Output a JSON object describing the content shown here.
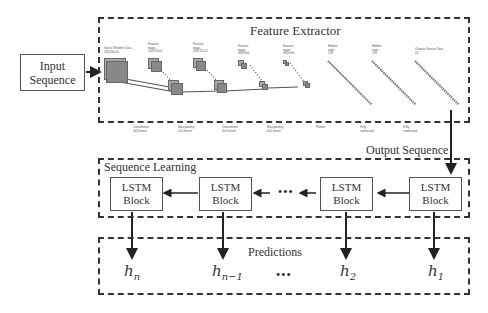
{
  "diagram": {
    "input_box": {
      "line1": "Input",
      "line2": "Sequence"
    },
    "feature_extractor": {
      "title": "Feature Extractor",
      "layer_labels_top": [
        {
          "l1": "Inputs Weather Data",
          "l2": "32@24x24"
        },
        {
          "l1": "Feature",
          "l2": "maps",
          "l3": "24@12x12"
        },
        {
          "l1": "Feature",
          "l2": "maps",
          "l3": "24@12x12"
        },
        {
          "l1": "Feature",
          "l2": "maps",
          "l3": "48@6x6"
        },
        {
          "l1": "Feature",
          "l2": "maps",
          "l3": "48@6x6"
        },
        {
          "l1": "Hidden",
          "l2": "units",
          "l3": "128"
        },
        {
          "l1": "Hidden",
          "l2": "units",
          "l3": "128"
        },
        {
          "l1": "Outputs Sensor Data",
          "l2": "24"
        }
      ],
      "operation_labels_bottom": [
        {
          "l1": "Convolution",
          "l2": "3x3 kernel"
        },
        {
          "l1": "Max-pooling",
          "l2": "2x2 kernel"
        },
        {
          "l1": "Convolution",
          "l2": "3x3 kernel"
        },
        {
          "l1": "Max-pooling",
          "l2": "2x2 kernel"
        },
        {
          "l1": "Flatten",
          "l2": ""
        },
        {
          "l1": "Fully",
          "l2": "connected"
        },
        {
          "l1": "Fully",
          "l2": "connected"
        }
      ]
    },
    "output_sequence_label": "Output Sequence",
    "sequence_learning": {
      "title": "Sequence Learning",
      "blocks": [
        {
          "line1": "LSTM",
          "line2": "Block"
        },
        {
          "line1": "LSTM",
          "line2": "Block"
        },
        {
          "line1": "LSTM",
          "line2": "Block"
        },
        {
          "line1": "LSTM",
          "line2": "Block"
        }
      ],
      "ellipsis": "•••"
    },
    "predictions": {
      "title": "Predictions",
      "outputs": [
        {
          "base": "h",
          "sub": "n"
        },
        {
          "base": "h",
          "sub": "n−1"
        },
        {
          "base": "h",
          "sub": "2"
        },
        {
          "base": "h",
          "sub": "1"
        }
      ],
      "ellipsis": "•••"
    },
    "colors": {
      "line": "#333333",
      "feature_map": "#888888",
      "box_border": "#555555"
    }
  }
}
